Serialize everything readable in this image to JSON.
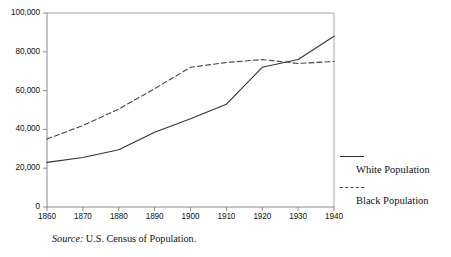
{
  "chart_data": {
    "type": "line",
    "title": "",
    "subtitle": "",
    "xlabel": "",
    "ylabel": "",
    "x": [
      1860,
      1870,
      1880,
      1890,
      1900,
      1910,
      1920,
      1930,
      1940
    ],
    "xtick_labels": [
      "1860",
      "1870",
      "1880",
      "1890",
      "1900",
      "1910",
      "1920",
      "1930",
      "1940"
    ],
    "ytick_labels": [
      "0",
      "20,000",
      "40,000",
      "60,000",
      "80,000",
      "100,000"
    ],
    "ytick_values": [
      0,
      20000,
      40000,
      60000,
      80000,
      100000
    ],
    "xlim": [
      1860,
      1940
    ],
    "ylim": [
      0,
      100000
    ],
    "grid": false,
    "legend_position": "right",
    "series": [
      {
        "name": "White Population",
        "style": "solid",
        "color": "#333333",
        "values": [
          23000,
          25500,
          29500,
          38500,
          45500,
          53000,
          72000,
          76000,
          88000
        ]
      },
      {
        "name": "Black Population",
        "style": "dashed",
        "color": "#444444",
        "values": [
          35000,
          42000,
          50500,
          61000,
          72000,
          74500,
          76000,
          74000,
          75000
        ]
      }
    ],
    "annotations": []
  },
  "legend": {
    "items": [
      {
        "label": "White Population",
        "style": "solid"
      },
      {
        "label": "Black Population",
        "style": "dashed"
      }
    ]
  },
  "source": {
    "keyword": "Source:",
    "text": " U.S. Census of Population."
  },
  "colors": {
    "axis": "#999999",
    "line_solid": "#333333",
    "line_dashed": "#444444",
    "text": "#111111",
    "background": "#ffffff"
  }
}
